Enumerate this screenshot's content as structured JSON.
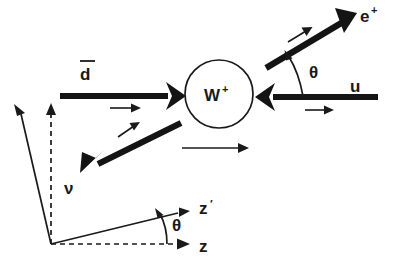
{
  "diagram": {
    "background_color": "#ffffff",
    "line_color": "#1a1a1a",
    "particles": {
      "dbar": {
        "label": "d",
        "overbar": true,
        "name": "anti-down-quark"
      },
      "u": {
        "label": "u",
        "name": "up-quark"
      },
      "w_boson": {
        "label": "W",
        "superscript": "+",
        "name": "w-plus-boson"
      },
      "positron": {
        "label": "e",
        "superscript": "+",
        "name": "positron"
      },
      "neutrino": {
        "label": "ν",
        "name": "neutrino"
      }
    },
    "angles": {
      "decay_theta": "θ",
      "frame_theta": "θ"
    },
    "axes": {
      "z_prime": {
        "label": "z",
        "prime": "′",
        "name": "z-prime-axis"
      },
      "z": {
        "label": "z",
        "name": "z-axis"
      }
    }
  }
}
